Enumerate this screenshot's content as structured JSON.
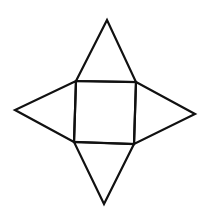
{
  "diagram": {
    "stroke_color": "#111111",
    "background": "#ffffff",
    "square": [
      [
        76,
        81
      ],
      [
        136,
        82
      ],
      [
        134,
        144
      ],
      [
        74,
        142
      ]
    ],
    "triangles": {
      "top": [
        [
          76,
          81
        ],
        [
          107,
          20
        ],
        [
          136,
          82
        ]
      ],
      "right": [
        [
          136,
          82
        ],
        [
          195,
          114
        ],
        [
          134,
          144
        ]
      ],
      "bottom": [
        [
          134,
          144
        ],
        [
          104,
          204
        ],
        [
          74,
          142
        ]
      ],
      "left": [
        [
          74,
          142
        ],
        [
          15,
          110
        ],
        [
          76,
          81
        ]
      ]
    }
  }
}
